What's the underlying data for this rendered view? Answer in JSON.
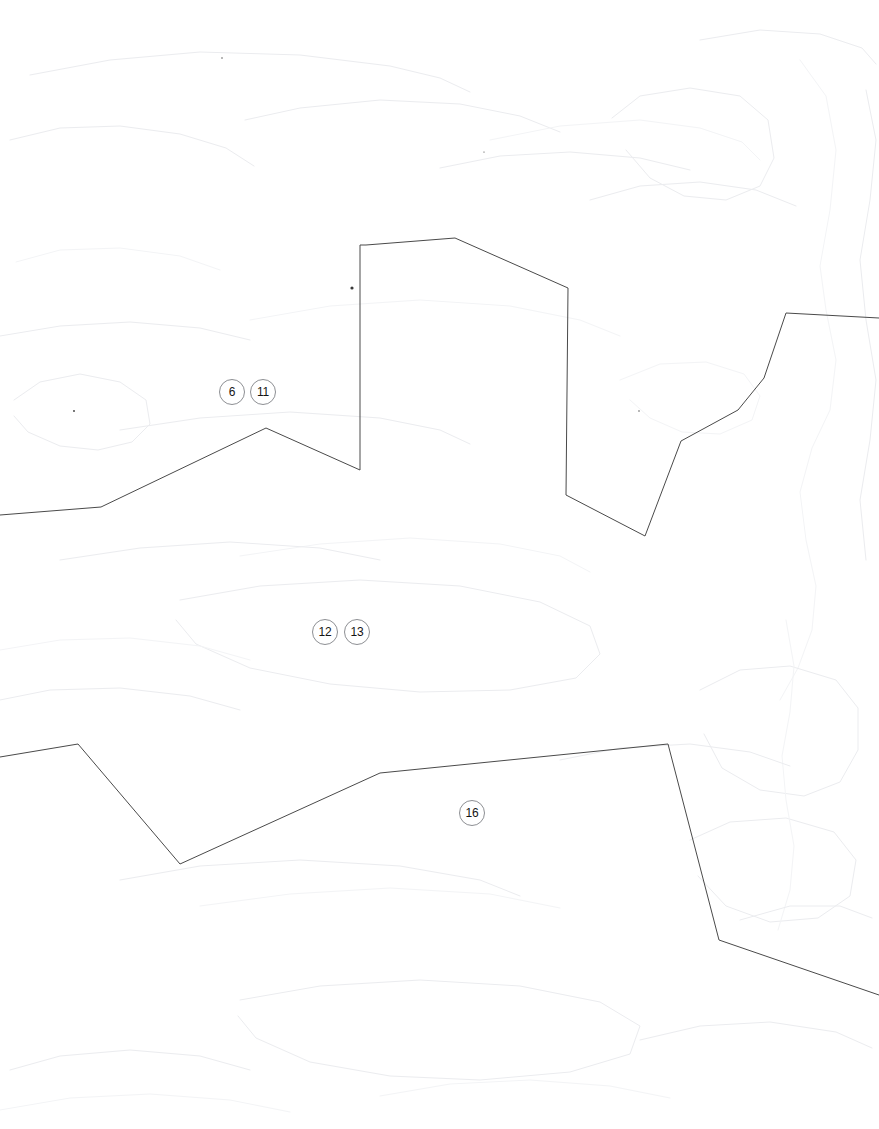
{
  "document": {
    "title": "Map Boundary Sketch",
    "background_color": "#ffffff",
    "width": 879,
    "height": 1129
  },
  "style": {
    "boundary_stroke": "#4a4a4a",
    "badge_border": "#8d8f93",
    "badge_text": "#141414",
    "contour_stroke": "#ebecef"
  },
  "badges": [
    {
      "label": "6",
      "x": 219,
      "y": 379
    },
    {
      "label": "11",
      "x": 250,
      "y": 379
    },
    {
      "label": "12",
      "x": 312,
      "y": 619
    },
    {
      "label": "13",
      "x": 344,
      "y": 619
    },
    {
      "label": "16",
      "x": 459,
      "y": 800
    }
  ],
  "boundaries": [
    {
      "name": "upper-boundary-line",
      "points": "0,515 101,507 266,428 360,470 360,245 366,245 455,238 568,288 566,495 645,536 681,441 738,410 764,378 786,313 879,318"
    },
    {
      "name": "lower-boundary-line",
      "points": "0,757 78,744 180,864 380,773 668,744 719,940 879,995"
    }
  ],
  "contours": [
    {
      "name": "contour-top-left",
      "points": "30,75 110,60 200,52 300,55 390,66 440,78 470,92"
    },
    {
      "name": "contour-top-mid",
      "points": "245,120 300,108 380,100 460,104 520,116 560,132"
    },
    {
      "name": "contour-top-right-a",
      "points": "490,140 560,126 640,120 700,128 742,142 760,160"
    },
    {
      "name": "contour-top-right-b",
      "points": "700,40 760,30 820,34 862,48 876,64"
    },
    {
      "name": "contour-upper-right-blob",
      "points": "612,118 640,96 690,88 740,96 768,120 774,158 760,186 726,200 684,196 650,178 626,150"
    },
    {
      "name": "contour-right-tall",
      "points": "800,60 826,96 836,150 830,210 820,266 826,310 836,360 830,410 812,448 800,492 806,540 816,586 812,630 798,668 780,700"
    },
    {
      "name": "contour-right-edge",
      "points": "866,90 876,140 870,200 860,260 866,320 876,380 870,440 860,500 866,560"
    },
    {
      "name": "contour-midleft-a",
      "points": "10,140 60,128 120,126 180,134 226,148 254,166"
    },
    {
      "name": "contour-midleft-b",
      "points": "16,262 60,250 120,248 180,256 220,270"
    },
    {
      "name": "contour-blob-left",
      "points": "14,400 40,382 80,374 120,382 146,400 150,424 132,442 98,450 60,446 28,432 14,416"
    },
    {
      "name": "contour-mid-a",
      "points": "120,430 200,418 290,412 380,418 440,430 470,444"
    },
    {
      "name": "contour-mid-b",
      "points": "240,556 320,544 410,538 500,544 560,556 590,572"
    },
    {
      "name": "contour-mid-c",
      "points": "60,560 140,548 230,542 320,548 380,560"
    },
    {
      "name": "contour-center-blob",
      "points": "180,600 260,586 360,580 460,586 540,602 590,626 600,654 576,678 510,690 420,692 330,684 250,668 196,644 176,620"
    },
    {
      "name": "contour-lower-left-a",
      "points": "0,650 60,640 130,638 200,646 250,660"
    },
    {
      "name": "contour-lower-left-b",
      "points": "0,700 50,690 120,688 190,696 240,710"
    },
    {
      "name": "contour-lower-mid",
      "points": "120,880 200,866 300,860 400,866 480,880 520,896"
    },
    {
      "name": "contour-lower-mid-b",
      "points": "200,906 290,894 390,888 490,894 560,908"
    },
    {
      "name": "contour-bottom-blob",
      "points": "240,1000 320,986 420,980 520,986 600,1002 640,1026 630,1054 570,1072 480,1080 390,1076 310,1062 256,1038 238,1016"
    },
    {
      "name": "contour-bottom-left",
      "points": "10,1070 60,1056 130,1050 200,1056 250,1070"
    },
    {
      "name": "contour-bottom-left-b",
      "points": "0,1110 70,1098 150,1094 230,1100 290,1112"
    },
    {
      "name": "contour-right-lower-blob",
      "points": "700,690 740,670 790,666 836,680 858,708 858,750 840,782 804,796 760,790 722,768 704,734"
    },
    {
      "name": "contour-right-lower-b",
      "points": "690,840 730,822 786,818 834,832 856,860 850,896 818,918 770,922 726,906 698,876"
    },
    {
      "name": "contour-right-vert",
      "points": "786,620 794,666 790,712 782,756 786,800 794,846 790,890 778,930"
    },
    {
      "name": "contour-right-bottom",
      "points": "640,1040 700,1026 770,1022 836,1032 872,1048"
    },
    {
      "name": "contour-far-right-a",
      "points": "740,920 790,906 840,906 872,918"
    },
    {
      "name": "contour-mid-right-a",
      "points": "620,380 660,364 706,362 744,374 760,396 752,420 720,434 682,432 650,418 630,400"
    },
    {
      "name": "contour-mid-right-b",
      "points": "590,200 640,186 700,182 756,190 796,206"
    },
    {
      "name": "contour-upper-mid-a",
      "points": "440,168 500,156 570,152 640,158 690,170"
    },
    {
      "name": "contour-sweep-a",
      "points": "250,320 330,306 420,300 510,306 580,320 620,336"
    },
    {
      "name": "contour-sweep-b",
      "points": "0,336 60,326 130,322 200,328 250,340"
    },
    {
      "name": "contour-lower-right-c",
      "points": "560,760 620,748 690,744 750,752 790,766"
    },
    {
      "name": "contour-tail-a",
      "points": "380,1096 450,1084 530,1080 610,1086 670,1098"
    }
  ],
  "specks": [
    {
      "name": "ink-speck-main",
      "x": 352,
      "y": 288,
      "r": 1.6
    },
    {
      "name": "ink-speck-left",
      "x": 74,
      "y": 411,
      "r": 0.9
    },
    {
      "name": "ink-speck-upper",
      "x": 222,
      "y": 58,
      "r": 0.7
    },
    {
      "name": "ink-speck-right",
      "x": 639,
      "y": 411,
      "r": 0.7
    },
    {
      "name": "ink-speck-mid",
      "x": 484,
      "y": 152,
      "r": 0.6
    }
  ]
}
